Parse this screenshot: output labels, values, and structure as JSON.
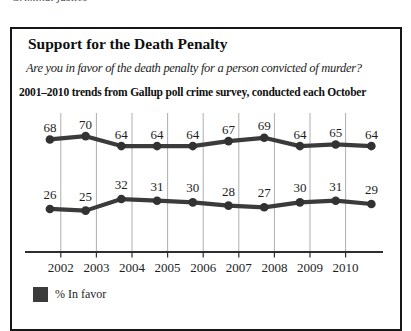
{
  "page": {
    "cropped_top_text": "Criminal justice"
  },
  "figure": {
    "title": "Support for the Death Penalty",
    "question": "Are you in favor of the death penalty for a person convicted of murder?",
    "survey_note": "2001–2010 trends from Gallup poll crime survey, conducted each October",
    "legend": {
      "in_favor_label": "% In favor"
    }
  },
  "colors": {
    "line": "#3b3b3b",
    "point": "#323232",
    "gridline": "#aeaeae",
    "axis": "#2e2e2e",
    "panel_border": "#161616",
    "text": "#1d1d1d"
  },
  "chart_data": {
    "type": "line",
    "title": "Support for the Death Penalty",
    "subtitle": "Are you in favor of the death penalty for a person convicted of murder?",
    "note": "2001–2010 trends from Gallup poll crime survey, conducted each October",
    "x": [
      2001,
      2002,
      2003,
      2004,
      2005,
      2006,
      2007,
      2008,
      2009,
      2010
    ],
    "x_tick_labels": [
      "2002",
      "2003",
      "2004",
      "2005",
      "2006",
      "2007",
      "2008",
      "2009",
      "2010"
    ],
    "series": [
      {
        "name": "% In favor",
        "values": [
          68,
          70,
          64,
          64,
          64,
          67,
          69,
          64,
          65,
          64
        ]
      },
      {
        "name": "",
        "values": [
          26,
          25,
          32,
          31,
          30,
          28,
          27,
          30,
          31,
          29
        ]
      }
    ],
    "ylim": [
      0,
      84
    ],
    "grid": "vertical-gridlines",
    "legend_position": "bottom-left",
    "data_labels": true
  }
}
